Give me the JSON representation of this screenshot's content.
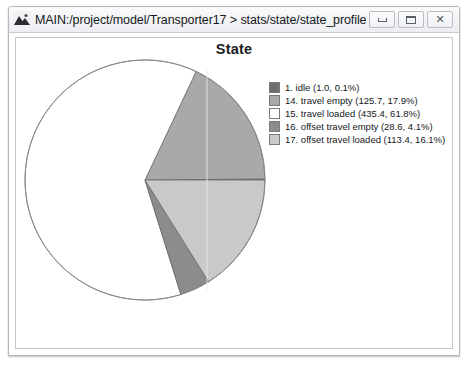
{
  "window": {
    "icon": "mountain-app-icon",
    "title": "MAIN:/project/model/Transporter17 > stats/state/state_profile As Graph",
    "controls": {
      "minimize_label": "",
      "maximize_label": "",
      "close_label": "✕"
    }
  },
  "chart_data": {
    "type": "pie",
    "title": "State",
    "xlabel": "",
    "ylabel": "",
    "legend_position": "right",
    "grid": false,
    "start_angle_deg": 0,
    "direction": "counterclockwise",
    "categories": [
      "1. idle",
      "14. travel empty",
      "15. travel loaded",
      "16. offset travel empty",
      "17. offset travel loaded"
    ],
    "values": [
      1.0,
      125.7,
      435.4,
      28.6,
      113.4
    ],
    "percentages": [
      0.1,
      17.9,
      61.8,
      4.1,
      16.1
    ],
    "colors": [
      "#6e6e6e",
      "#a9a9a9",
      "#ffffff",
      "#8c8c8c",
      "#c9c9c9"
    ],
    "legend_entries": [
      "1. idle (1.0, 0.1%)",
      "14. travel empty (125.7, 17.9%)",
      "15. travel loaded (435.4, 61.8%)",
      "16. offset travel empty (28.6, 4.1%)",
      "17. offset travel loaded (113.4, 16.1%)"
    ]
  }
}
